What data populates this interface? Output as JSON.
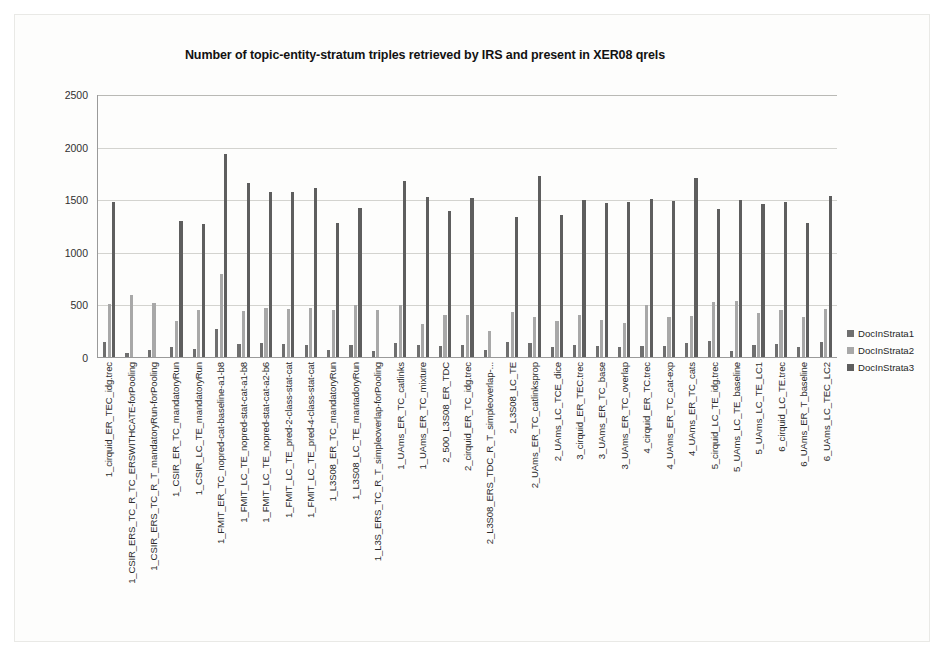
{
  "chart_data": {
    "type": "bar",
    "title": "Number of topic-entity-stratum triples retrieved by IRS and present in XER08 qrels",
    "xlabel": "",
    "ylabel": "",
    "ylim": [
      0,
      2500
    ],
    "yticks": [
      0,
      500,
      1000,
      1500,
      2000,
      2500
    ],
    "ytick_labels": [
      "0",
      "500",
      "1000",
      "1500",
      "2000",
      "2500"
    ],
    "grid": true,
    "legend_position": "right",
    "colors": {
      "DocInStrata1": "#6f6f6f",
      "DocInStrata2": "#a8a8a8",
      "DocInStrata3": "#5e5e5e"
    },
    "categories": [
      "1_cirquid_ER_TEC_idg.trec",
      "1_CSIR_ERS_TC_R_TC_ERSWITHCATE-forPooling",
      "1_CSIR_ERS_TC_R_T_mandatoryRun-forPooling",
      "1_CSIR_ER_TC_mandatoryRun",
      "1_CSIR_LC_TE_mandatoryRun",
      "1_FMIT_ER_TC_nopred-cat-baseline-a1-b8",
      "1_FMIT_LC_TE_nopred-stat-cat-a1-b8",
      "1_FMIT_LC_TE_nopred-stat-cat-a2-b6",
      "1_FMIT_LC_TE_pred-2-class-stat-cat",
      "1_FMIT_LC_TE_pred-4-class-stat-cat",
      "1_L3S08_ER_TC_mandatoryRun",
      "1_L3S08_LC_TE_mantadoryRun",
      "1_L3S_ERS_TC_R_T_simpleoverlap-forPooling",
      "1_UAms_ER_TC_catlinks",
      "1_UAms_ER_TC_mixture",
      "2_500_L3S08_ER_TDC",
      "2_cirquid_ER_TC_idg.trec",
      "2_L3S08_ERS_TDC_R_T_simpleoverlap-...",
      "2_L3S08_LC_TE",
      "2_UAms_ER_TC_catlinksprop",
      "2_UAms_LC_TCE_dice",
      "3_cirquid_ER_TEC.trec",
      "3_UAms_ER_TC_base",
      "3_UAms_ER_TC_overlap",
      "4_cirquid_ER_TC.trec",
      "4_UAms_ER_TC_cat-exp",
      "4_UAms_ER_TC_cats",
      "5_cirquid_LC_TE_idg.trec",
      "5_UAms_LC_TE_baseline",
      "5_UAms_LC_TE_LC1",
      "6_cirquid_LC_TE.trec",
      "6_UAms_ER_T_baseline",
      "6_UAms_LC_TEC_LC2"
    ],
    "series": [
      {
        "name": "DocInStrata1",
        "values": [
          140,
          40,
          70,
          95,
          80,
          270,
          120,
          130,
          120,
          115,
          70,
          115,
          55,
          130,
          110,
          100,
          110,
          70,
          140,
          135,
          95,
          110,
          100,
          95,
          100,
          105,
          135,
          150,
          60,
          110,
          125,
          95,
          145
        ]
      },
      {
        "name": "DocInStrata2",
        "values": [
          500,
          590,
          510,
          340,
          445,
          790,
          440,
          470,
          460,
          465,
          445,
          490,
          450,
          490,
          310,
          400,
          395,
          250,
          425,
          385,
          340,
          400,
          355,
          320,
          495,
          385,
          390,
          520,
          530,
          420,
          450,
          380,
          455
        ]
      },
      {
        "name": "DocInStrata3",
        "values": [
          1470,
          0,
          0,
          1295,
          1265,
          1930,
          1655,
          1570,
          1565,
          1610,
          1275,
          1415,
          0,
          1675,
          1520,
          1390,
          1510,
          0,
          1330,
          1720,
          1350,
          1495,
          1465,
          1470,
          1500,
          1480,
          1705,
          1405,
          1490,
          1455,
          1470,
          1275,
          1535
        ]
      }
    ]
  },
  "legend": {
    "entries": [
      {
        "label": "DocInStrata1"
      },
      {
        "label": "DocInStrata2"
      },
      {
        "label": "DocInStrata3"
      }
    ]
  }
}
